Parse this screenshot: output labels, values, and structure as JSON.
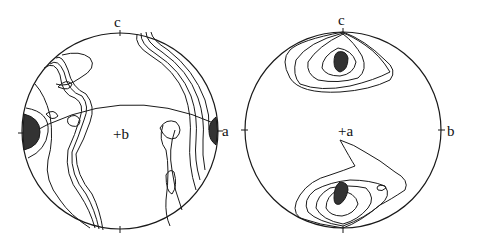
{
  "figure": {
    "type": "stereonet pole-figure contour diagrams",
    "panels": [
      {
        "id": "left",
        "axis_labels": {
          "top": "c",
          "right": "a",
          "center": "+b"
        },
        "ticks": [
          "top",
          "bottom",
          "left",
          "right"
        ],
        "has_great_circle": true,
        "maxima": [
          "left-edge",
          "right-edge"
        ]
      },
      {
        "id": "right",
        "axis_labels": {
          "top": "c",
          "right": "b",
          "center": "+a"
        },
        "ticks": [
          "top",
          "bottom",
          "left",
          "right"
        ],
        "has_great_circle": false,
        "maxima": [
          "upper",
          "lower"
        ]
      }
    ]
  },
  "colors": {
    "line": "#1a1a1a",
    "maximum_fill": "#333333",
    "background": "#ffffff"
  }
}
